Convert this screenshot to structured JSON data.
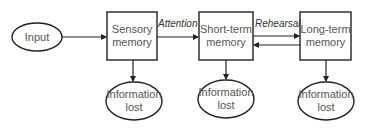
{
  "diagram": {
    "colors": {
      "stroke": "#222222",
      "text": "#555555",
      "background": "#ffffff"
    },
    "nodes": {
      "input": {
        "label": "Input",
        "shape": "ellipse"
      },
      "sensory": {
        "line1": "Sensory",
        "line2": "memory",
        "shape": "rectangle"
      },
      "short_term": {
        "line1": "Short-term",
        "line2": "memory",
        "shape": "rectangle"
      },
      "long_term": {
        "line1": "Long-term",
        "line2": "memory",
        "shape": "rectangle"
      },
      "lost_sensory": {
        "line1": "Information",
        "line2": "lost",
        "shape": "ellipse"
      },
      "lost_short_term": {
        "line1": "Information",
        "line2": "lost",
        "shape": "ellipse"
      },
      "lost_long_term": {
        "line1": "Information",
        "line2": "lost",
        "shape": "ellipse"
      }
    },
    "edges": {
      "input_to_sensory": {
        "label": ""
      },
      "sensory_to_short_term": {
        "label": "Attention"
      },
      "short_term_to_long_term": {
        "label": "Rehearsal"
      },
      "long_term_to_short_term": {
        "label": ""
      },
      "sensory_to_lost": {
        "label": ""
      },
      "short_term_to_lost": {
        "label": ""
      },
      "long_term_to_lost": {
        "label": ""
      }
    }
  }
}
